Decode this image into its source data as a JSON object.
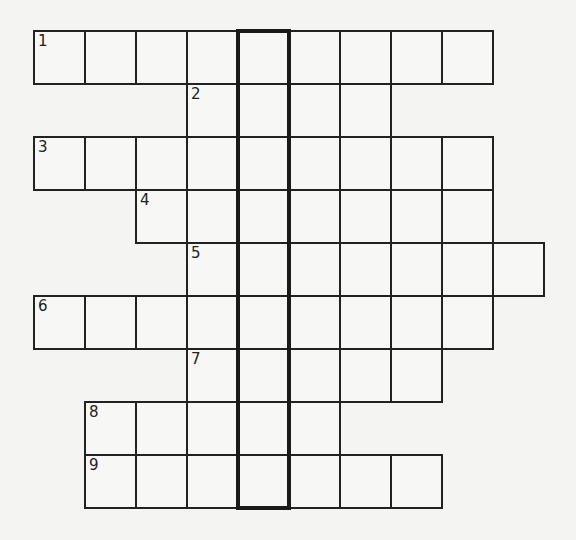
{
  "puzzle": {
    "type": "crossword",
    "grid": {
      "origin_x": 34,
      "origin_y": 31,
      "cell_w": 51,
      "cell_h": 53,
      "cols": 10,
      "rows": 9
    },
    "colors": {
      "background": "#f4f4f2",
      "cell_fill": "#f7f7f5",
      "line": "#222222"
    },
    "rows": [
      {
        "clue_number": "1",
        "start_col": 0,
        "end_col": 8
      },
      {
        "clue_number": "2",
        "start_col": 3,
        "end_col": 6
      },
      {
        "clue_number": "3",
        "start_col": 0,
        "end_col": 8
      },
      {
        "clue_number": "4",
        "start_col": 2,
        "end_col": 8
      },
      {
        "clue_number": "5",
        "start_col": 3,
        "end_col": 9
      },
      {
        "clue_number": "6",
        "start_col": 0,
        "end_col": 8
      },
      {
        "clue_number": "7",
        "start_col": 3,
        "end_col": 7
      },
      {
        "clue_number": "8",
        "start_col": 1,
        "end_col": 5
      },
      {
        "clue_number": "9",
        "start_col": 1,
        "end_col": 7
      }
    ],
    "highlighted_column": {
      "col": 4,
      "start_row": 0,
      "end_row": 8
    }
  }
}
